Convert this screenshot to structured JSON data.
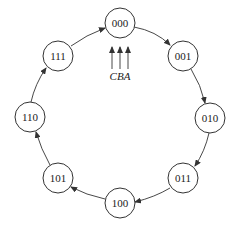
{
  "diagram": {
    "type": "state-transition-cycle",
    "nodes": [
      {
        "id": "000",
        "label": "000",
        "cx": 120,
        "cy": 23
      },
      {
        "id": "001",
        "label": "001",
        "cx": 183,
        "cy": 56
      },
      {
        "id": "010",
        "label": "010",
        "cx": 210,
        "cy": 118
      },
      {
        "id": "011",
        "label": "011",
        "cx": 183,
        "cy": 178
      },
      {
        "id": "100",
        "label": "100",
        "cx": 120,
        "cy": 203
      },
      {
        "id": "101",
        "label": "101",
        "cx": 58,
        "cy": 178
      },
      {
        "id": "110",
        "label": "110",
        "cx": 30,
        "cy": 117
      },
      {
        "id": "111",
        "label": "111",
        "cx": 58,
        "cy": 56
      }
    ],
    "edges": [
      {
        "from": "000",
        "to": "001"
      },
      {
        "from": "001",
        "to": "010"
      },
      {
        "from": "010",
        "to": "011"
      },
      {
        "from": "011",
        "to": "100"
      },
      {
        "from": "100",
        "to": "101"
      },
      {
        "from": "101",
        "to": "110"
      },
      {
        "from": "110",
        "to": "111"
      },
      {
        "from": "111",
        "to": "000"
      }
    ],
    "inputs": {
      "label": "CBA",
      "arrow_count": 3,
      "target": "000"
    },
    "colors": {
      "stroke": "#333333",
      "text": "#222222",
      "background": "#ffffff"
    }
  }
}
